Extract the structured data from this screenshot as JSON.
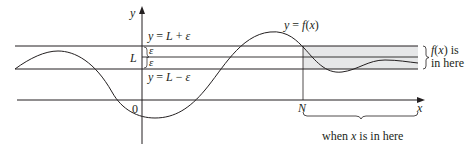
{
  "diagram": {
    "colors": {
      "line": "#231f20",
      "band": "#e6e7e8",
      "background": "#ffffff"
    },
    "axes": {
      "x_label": "x",
      "y_label": "y",
      "origin_label": "0"
    },
    "lines": {
      "upper_label": "y = L + ε",
      "lower_label": "y = L − ε",
      "L_label": "L",
      "epsilon_upper": "ε",
      "epsilon_lower": "ε"
    },
    "curve": {
      "label": "y = f(x)"
    },
    "N_label": "N",
    "right_brace_label_line1": "f(x) is",
    "right_brace_label_line2": "in here",
    "bottom_brace_label": "when x is in here"
  }
}
